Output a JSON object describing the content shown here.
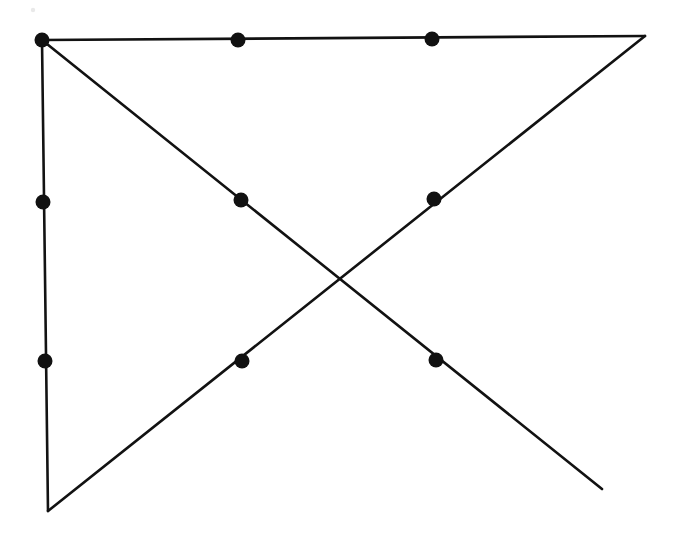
{
  "figure": {
    "title": "Geometric line figure with crossing diagonals",
    "canvas": {
      "width": 676,
      "height": 538,
      "background": "#ffffff"
    },
    "style": {
      "line_color": "#121212",
      "line_width": 2.6,
      "dot_color": "#111111",
      "dot_radius": 7.5,
      "speck_color": "#e9e9e9"
    },
    "vertices": [
      {
        "name": "top-left",
        "x": 42,
        "y": 40
      },
      {
        "name": "top-right",
        "x": 645,
        "y": 36
      },
      {
        "name": "bottom-left",
        "x": 48,
        "y": 511
      },
      {
        "name": "diagonal-open-end",
        "x": 602,
        "y": 489
      }
    ],
    "crossing_point": {
      "name": "diagonal-intersection",
      "x": 345,
      "y": 281
    },
    "segments": [
      {
        "name": "top-edge",
        "from": {
          "x": 42,
          "y": 40
        },
        "to": {
          "x": 645,
          "y": 36
        },
        "orientation": "horizontal"
      },
      {
        "name": "left-edge",
        "from": {
          "x": 42,
          "y": 40
        },
        "to": {
          "x": 48,
          "y": 511
        },
        "orientation": "vertical"
      },
      {
        "name": "descending-diagonal",
        "from": {
          "x": 42,
          "y": 40
        },
        "to": {
          "x": 602,
          "y": 489
        },
        "orientation": "descending"
      },
      {
        "name": "ascending-diagonal",
        "from": {
          "x": 48,
          "y": 511
        },
        "to": {
          "x": 645,
          "y": 36
        },
        "orientation": "ascending"
      }
    ],
    "dots": [
      {
        "name": "dot-top-left-corner",
        "x": 42,
        "y": 40,
        "on": "top-edge"
      },
      {
        "name": "dot-top-edge-1",
        "x": 238,
        "y": 40,
        "on": "top-edge"
      },
      {
        "name": "dot-top-edge-2",
        "x": 432,
        "y": 39,
        "on": "top-edge"
      },
      {
        "name": "dot-left-edge-1",
        "x": 43,
        "y": 202,
        "on": "left-edge"
      },
      {
        "name": "dot-left-edge-2",
        "x": 45,
        "y": 361,
        "on": "left-edge"
      },
      {
        "name": "dot-descending-upper",
        "x": 241,
        "y": 200,
        "on": "descending-diagonal"
      },
      {
        "name": "dot-descending-lower",
        "x": 436,
        "y": 360,
        "on": "descending-diagonal"
      },
      {
        "name": "dot-ascending-upper",
        "x": 434,
        "y": 199,
        "on": "ascending-diagonal"
      },
      {
        "name": "dot-ascending-lower",
        "x": 242,
        "y": 361,
        "on": "ascending-diagonal"
      }
    ],
    "specks": [
      {
        "name": "scan-speck",
        "x": 33,
        "y": 10,
        "r": 2.2
      }
    ]
  }
}
